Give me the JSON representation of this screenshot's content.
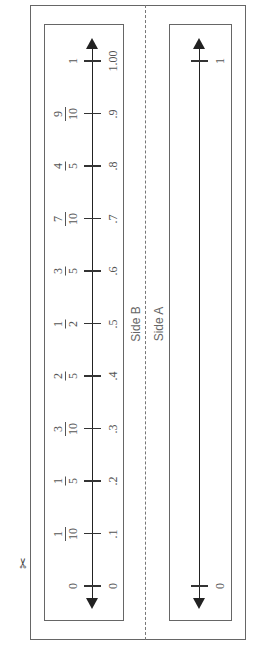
{
  "sheet": {
    "orientation": "rotated-90-ccw",
    "cut_icon": "scissors-icon",
    "cut_glyph": "✂",
    "colors": {
      "lines": "#222222",
      "frame": "#666666",
      "text": "#555555"
    }
  },
  "side_b": {
    "label": "Side B",
    "number_line": {
      "start_label": "0",
      "end_label": "1",
      "ticks": [
        {
          "value": 0,
          "fraction": "0",
          "num": "",
          "den": "",
          "decimal": "0"
        },
        {
          "value": 0.1,
          "fraction": "1/10",
          "num": "1",
          "den": "10",
          "decimal": ".1"
        },
        {
          "value": 0.2,
          "fraction": "1/5",
          "num": "1",
          "den": "5",
          "decimal": ".2"
        },
        {
          "value": 0.3,
          "fraction": "3/10",
          "num": "3",
          "den": "10",
          "decimal": ".3"
        },
        {
          "value": 0.4,
          "fraction": "2/5",
          "num": "2",
          "den": "5",
          "decimal": ".4"
        },
        {
          "value": 0.5,
          "fraction": "1/2",
          "num": "1",
          "den": "2",
          "decimal": ".5"
        },
        {
          "value": 0.6,
          "fraction": "3/5",
          "num": "3",
          "den": "5",
          "decimal": ".6"
        },
        {
          "value": 0.7,
          "fraction": "7/10",
          "num": "7",
          "den": "10",
          "decimal": ".7"
        },
        {
          "value": 0.8,
          "fraction": "4/5",
          "num": "4",
          "den": "5",
          "decimal": ".8"
        },
        {
          "value": 0.9,
          "fraction": "9/10",
          "num": "9",
          "den": "10",
          "decimal": ".9"
        },
        {
          "value": 1,
          "fraction": "1",
          "num": "",
          "den": "",
          "decimal": "1.00"
        }
      ]
    }
  },
  "side_a": {
    "label": "Side A",
    "number_line": {
      "ticks": [
        {
          "value": 0,
          "label": "0"
        },
        {
          "value": 1,
          "label": "1"
        }
      ]
    }
  }
}
